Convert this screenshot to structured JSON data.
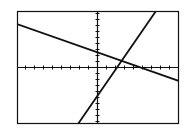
{
  "screen": {
    "width": 188,
    "height": 134,
    "background": "#ffffff",
    "ink": "#111111"
  },
  "frame": {
    "x": 17,
    "y": 11,
    "width": 162,
    "height": 113
  },
  "axes": {
    "x_axis_y": 67,
    "y_axis_x": 97,
    "x_tick_spacing_px": 9,
    "y_tick_spacing_px": 6,
    "tick_length_px": 2
  },
  "chart_data": {
    "type": "line",
    "title": "",
    "xlabel": "",
    "ylabel": "",
    "xlim": [
      -9,
      9
    ],
    "ylim": [
      -9,
      9
    ],
    "grid": false,
    "legend": "none",
    "x_ticks_every": 1,
    "y_ticks_every": 1,
    "series": [
      {
        "name": "line-1-decreasing",
        "slope": -0.56,
        "intercept": 2.5,
        "x": [
          -8.9,
          9.1
        ],
        "y": [
          7.2,
          -2.3
        ]
      },
      {
        "name": "line-2-increasing",
        "slope": 2.17,
        "intercept": -4.8,
        "x": [
          -2.1,
          6.6
        ],
        "y": [
          -9.5,
          9.3
        ]
      }
    ],
    "intersection": {
      "x": 2.7,
      "y": 1.0
    }
  },
  "lines_px": [
    {
      "name": "line-1-decreasing",
      "x1": 17,
      "y1": 24,
      "x2": 179,
      "y2": 81
    },
    {
      "name": "line-2-increasing",
      "x1": 78,
      "y1": 124,
      "x2": 156,
      "y2": 11
    }
  ]
}
